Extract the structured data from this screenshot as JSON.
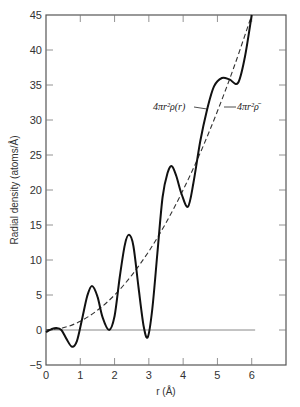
{
  "chart_data": {
    "type": "line",
    "title": "",
    "xlabel": "r (Å)",
    "ylabel": "Radial density (atoms/Å)",
    "xlim": [
      0,
      7
    ],
    "ylim": [
      -5,
      45
    ],
    "x_ticks": [
      0,
      1,
      2,
      3,
      4,
      5,
      6
    ],
    "y_ticks": [
      -5,
      0,
      5,
      10,
      15,
      20,
      25,
      30,
      35,
      40,
      45
    ],
    "grid": false,
    "baseline": {
      "y": 0,
      "x_range": [
        0,
        6.1
      ]
    },
    "series": [
      {
        "name": "4πr²ρ(r)",
        "style": "solid",
        "x": [
          0.0,
          0.15,
          0.3,
          0.45,
          0.6,
          0.76,
          0.9,
          1.05,
          1.2,
          1.34,
          1.5,
          1.65,
          1.84,
          2.0,
          2.15,
          2.3,
          2.42,
          2.55,
          2.7,
          2.85,
          2.97,
          3.1,
          3.25,
          3.4,
          3.55,
          3.67,
          3.8,
          3.95,
          4.14,
          4.3,
          4.5,
          4.7,
          4.9,
          5.13,
          5.35,
          5.6,
          5.8,
          6.0
        ],
        "values": [
          -0.3,
          0.1,
          0.3,
          0.0,
          -1.3,
          -2.4,
          -1.6,
          1.5,
          4.8,
          6.3,
          4.8,
          1.8,
          0.0,
          2.0,
          7.5,
          12.2,
          13.6,
          12.0,
          6.0,
          0.5,
          -1.0,
          3.0,
          11.0,
          19.0,
          22.5,
          23.4,
          22.0,
          19.5,
          17.6,
          21.0,
          27.0,
          31.5,
          34.8,
          36.0,
          35.8,
          35.3,
          39.0,
          45.0
        ]
      },
      {
        "name": "4πr²ρ̄",
        "style": "dashed",
        "x": [
          0,
          0.5,
          1,
          1.5,
          2,
          2.5,
          3,
          3.5,
          4,
          4.5,
          5,
          5.5,
          6
        ],
        "values": [
          0,
          0.31,
          1.25,
          2.81,
          5.0,
          7.81,
          11.25,
          15.31,
          20.0,
          25.31,
          31.25,
          37.81,
          45.0
        ]
      }
    ],
    "annotations": [
      {
        "text": "4πr²ρ(r)",
        "points_to": "4πr²ρ(r)"
      },
      {
        "text": "4πr²ρ̄",
        "points_to": "4πr²ρ̄"
      }
    ]
  }
}
